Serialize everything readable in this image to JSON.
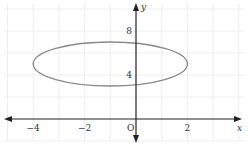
{
  "chart_data": {
    "type": "line",
    "title": "",
    "xlabel": "x",
    "ylabel": "y",
    "origin_label": "O",
    "xlim": [
      -5.2,
      4.3
    ],
    "ylim": [
      -2.2,
      10.2
    ],
    "x_ticks": [
      {
        "value": -4,
        "label": "−4"
      },
      {
        "value": -2,
        "label": "−2"
      },
      {
        "value": 2,
        "label": "2"
      }
    ],
    "y_ticks": [
      {
        "value": 4,
        "label": "4"
      },
      {
        "value": 8,
        "label": "8"
      }
    ],
    "grid": true,
    "series": [
      {
        "name": "ellipse",
        "shape": "ellipse",
        "center": [
          -1,
          5
        ],
        "semi_axis_x": 3,
        "semi_axis_y": 2,
        "color": "#8a8a8a"
      }
    ]
  },
  "colors": {
    "axis": "#222222",
    "grid": "#eeeeee",
    "curve": "#8a8a8a"
  }
}
